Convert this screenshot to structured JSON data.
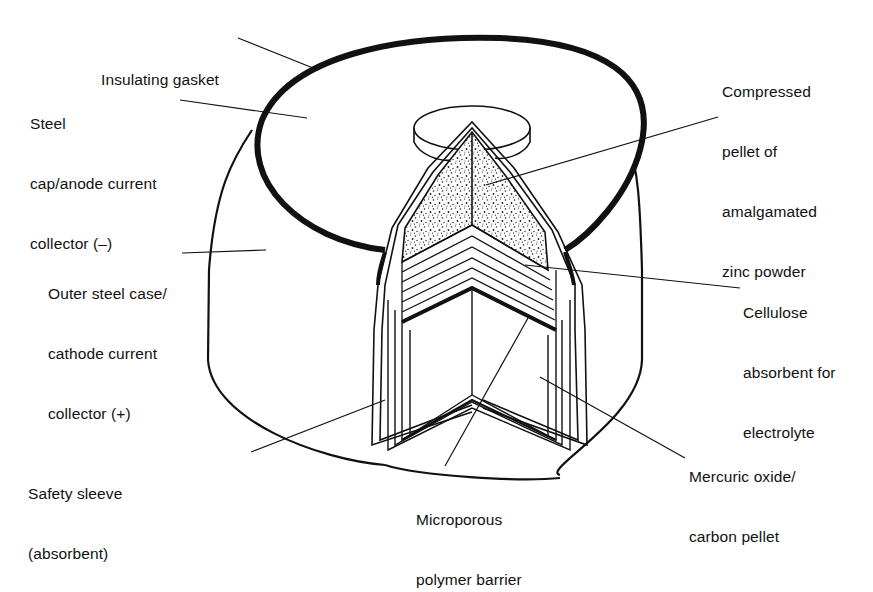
{
  "colors": {
    "ink": "#111111",
    "background": "#ffffff",
    "stipple": "#222222"
  },
  "labels": {
    "insulating_gasket": {
      "lines": [
        "Insulating gasket"
      ]
    },
    "steel_cap": {
      "lines": [
        "Steel",
        "cap/anode current",
        "collector (–)"
      ]
    },
    "outer_case": {
      "lines": [
        "Outer steel case/",
        "cathode current",
        "collector (+)"
      ]
    },
    "safety_sleeve": {
      "lines": [
        "Safety sleeve",
        "(absorbent)"
      ]
    },
    "microporous_barrier": {
      "lines": [
        "Microporous",
        "polymer barrier"
      ]
    },
    "mercuric_oxide": {
      "lines": [
        "Mercuric oxide/",
        "carbon pellet"
      ]
    },
    "cellulose": {
      "lines": [
        "Cellulose",
        "absorbent for",
        "electrolyte"
      ]
    },
    "zinc_pellet": {
      "lines": [
        "Compressed",
        "pellet of",
        "amalgamated",
        "zinc powder"
      ]
    }
  }
}
